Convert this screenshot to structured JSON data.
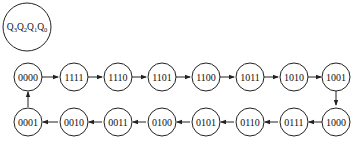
{
  "legend": {
    "label": "Q3Q2Q1Q0",
    "parts": [
      {
        "base": "Q",
        "sub": "3"
      },
      {
        "base": "Q",
        "sub": "2"
      },
      {
        "base": "Q",
        "sub": "1"
      },
      {
        "base": "Q",
        "sub": "0"
      }
    ]
  },
  "states_top": [
    "0000",
    "1111",
    "1110",
    "1101",
    "1100",
    "1011",
    "1010",
    "1001"
  ],
  "states_bottom": [
    "0001",
    "0010",
    "0011",
    "0100",
    "0101",
    "0110",
    "0111",
    "1000"
  ],
  "sequence": [
    "0000",
    "1111",
    "1110",
    "1101",
    "1100",
    "1011",
    "1010",
    "1001",
    "1000",
    "0111",
    "0110",
    "0101",
    "0100",
    "0011",
    "0010",
    "0001",
    "0000"
  ],
  "colors": {
    "stroke": "#222222",
    "background": "#ffffff"
  }
}
